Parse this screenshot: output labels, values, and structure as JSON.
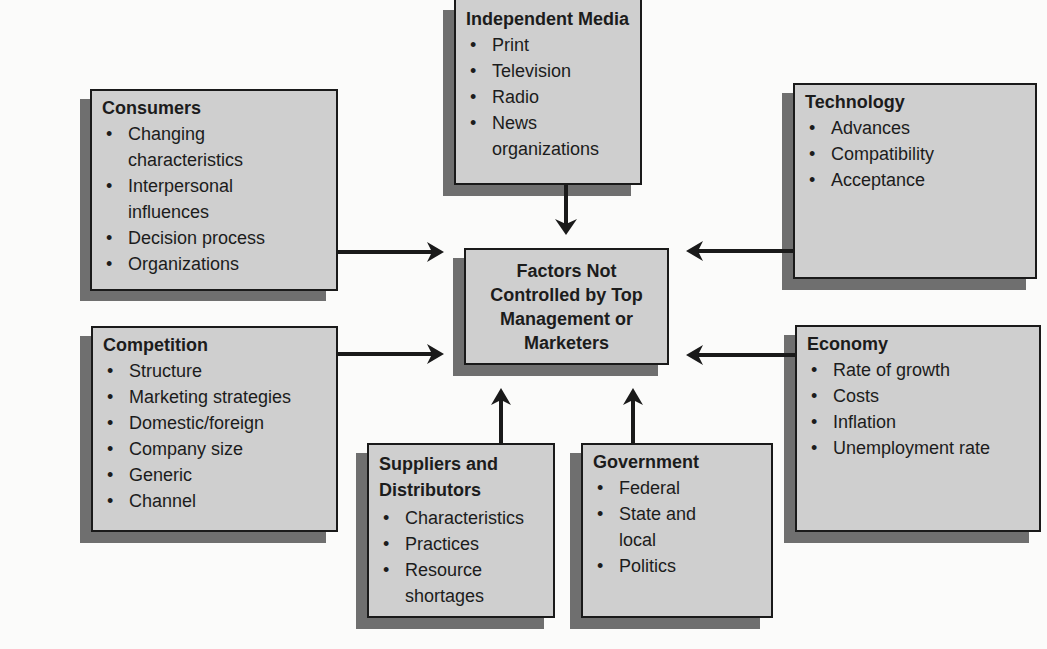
{
  "center": {
    "label": "Factors Not Controlled by Top Management or Marketers"
  },
  "boxes": {
    "media": {
      "title": "Independent Media",
      "items": [
        "Print",
        "Television",
        "Radio",
        "News organizations"
      ]
    },
    "consumers": {
      "title": "Consumers",
      "items": [
        "Changing characteristics",
        "Interpersonal influences",
        "Decision process",
        "Organizations"
      ]
    },
    "technology": {
      "title": "Technology",
      "items": [
        "Advances",
        "Compatibility",
        "Acceptance"
      ]
    },
    "competition": {
      "title": "Competition",
      "items": [
        "Structure",
        "Marketing strategies",
        "Domestic/foreign",
        "Company size",
        "Generic",
        "Channel"
      ]
    },
    "economy": {
      "title": "Economy",
      "items": [
        "Rate of growth",
        "Costs",
        "Inflation",
        "Unemployment rate"
      ]
    },
    "suppliers": {
      "title": "Suppliers and Distributors",
      "items": [
        "Characteristics",
        "Practices",
        "Resource shortages"
      ]
    },
    "government": {
      "title": "Government",
      "items": [
        "Federal",
        "State and local",
        "Politics"
      ]
    }
  },
  "colors": {
    "box_fill": "#cfcfcf",
    "shadow": "#6f6f6f",
    "border": "#1a1a1a",
    "background": "#fbfbfa"
  }
}
